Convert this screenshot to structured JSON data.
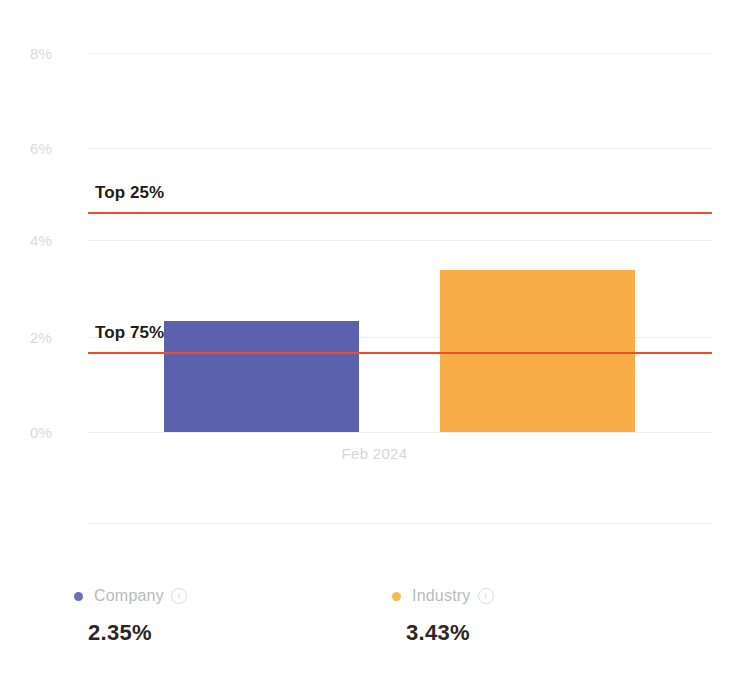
{
  "chart_data": {
    "type": "bar",
    "title": "",
    "subtitle": "",
    "xlabel": "",
    "ylabel": "",
    "categories": [
      "Feb 2024"
    ],
    "ylim": [
      0,
      8
    ],
    "ytick_labels": [
      "0%",
      "2%",
      "4%",
      "6%",
      "8%"
    ],
    "ytick_values": [
      0,
      2,
      4,
      6,
      8
    ],
    "grid": true,
    "legend_position": "bottom",
    "series": [
      {
        "name": "Company",
        "values": [
          2.35
        ],
        "value_label": "2.35%",
        "color": "#5b61ad",
        "legend_dot_color": "#6b6fc0"
      },
      {
        "name": "Industry",
        "values": [
          3.43
        ],
        "value_label": "3.43%",
        "color": "#f9ad49",
        "legend_dot_color": "#f9b94e"
      }
    ],
    "reference_lines": [
      {
        "label": "Top 25%",
        "value": 4.65,
        "color": "#f04b2a"
      },
      {
        "label": "Top 75%",
        "value": 1.68,
        "color": "#f04b2a"
      }
    ],
    "annotations": []
  },
  "axis": {
    "ytick_0": "0%",
    "ytick_1": "2%",
    "ytick_2": "4%",
    "ytick_3": "6%",
    "ytick_4": "8%",
    "xtick_0": "Feb 2024"
  },
  "reference": {
    "top25_label": "Top 25%",
    "top75_label": "Top 75%"
  },
  "legend": {
    "company": {
      "label": "Company",
      "value": "2.35%",
      "info_glyph": "i"
    },
    "industry": {
      "label": "Industry",
      "value": "3.43%",
      "info_glyph": "i"
    }
  },
  "colors": {
    "company_bar": "#5b61ad",
    "industry_bar": "#f9ad49",
    "reference_line": "#f04b2a",
    "gridline": "#edeef0",
    "tick_text": "#d9dadd",
    "legend_text": "#b9babd",
    "value_text": "#2d2723"
  }
}
